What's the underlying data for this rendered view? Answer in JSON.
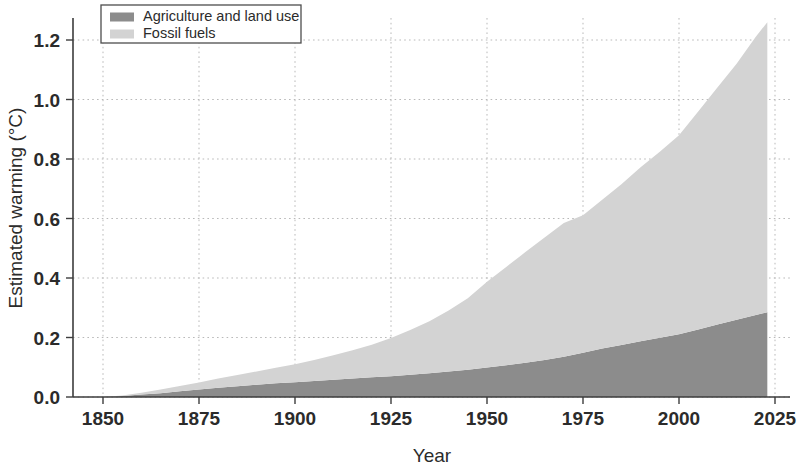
{
  "chart_data": {
    "type": "area",
    "stacked": true,
    "title": "",
    "subtitle": "",
    "xlabel": "Year",
    "ylabel": "Estimated warming (°C)",
    "xlim": [
      1845,
      2032
    ],
    "ylim": [
      -0.03,
      1.33
    ],
    "xticks": [
      1850,
      1875,
      1900,
      1925,
      1950,
      1975,
      2000,
      2025
    ],
    "xticklabels": [
      "1850",
      "1875",
      "1900",
      "1925",
      "1950",
      "1975",
      "2000",
      "2025"
    ],
    "yticks": [
      0.0,
      0.2,
      0.4,
      0.6,
      0.8,
      1.0,
      1.2
    ],
    "yticklabels": [
      "0.0",
      "0.2",
      "0.4",
      "0.6",
      "0.8",
      "1.0",
      "1.2"
    ],
    "grid": true,
    "grid_axis": "both",
    "legend_position": "top-left",
    "x": [
      1850,
      1855,
      1860,
      1865,
      1870,
      1875,
      1880,
      1885,
      1890,
      1895,
      1900,
      1905,
      1910,
      1915,
      1920,
      1925,
      1930,
      1935,
      1940,
      1945,
      1950,
      1955,
      1960,
      1965,
      1970,
      1975,
      1980,
      1985,
      1990,
      1995,
      2000,
      2005,
      2010,
      2015,
      2020,
      2023
    ],
    "series": [
      {
        "name": "Agriculture and land use",
        "color": "#8c8c8c",
        "values": [
          0.0,
          0.003,
          0.008,
          0.013,
          0.019,
          0.025,
          0.031,
          0.036,
          0.041,
          0.046,
          0.05,
          0.054,
          0.058,
          0.062,
          0.066,
          0.07,
          0.075,
          0.08,
          0.086,
          0.092,
          0.099,
          0.107,
          0.115,
          0.124,
          0.135,
          0.149,
          0.163,
          0.175,
          0.187,
          0.199,
          0.211,
          0.227,
          0.244,
          0.26,
          0.276,
          0.285
        ]
      },
      {
        "name": "Fossil fuels",
        "color": "#d3d3d3",
        "values": [
          0.0,
          0.002,
          0.006,
          0.012,
          0.018,
          0.024,
          0.031,
          0.038,
          0.045,
          0.052,
          0.06,
          0.07,
          0.082,
          0.095,
          0.11,
          0.128,
          0.15,
          0.175,
          0.205,
          0.24,
          0.288,
          0.33,
          0.372,
          0.412,
          0.45,
          0.462,
          0.5,
          0.54,
          0.585,
          0.625,
          0.669,
          0.733,
          0.796,
          0.86,
          0.935,
          0.975
        ]
      }
    ],
    "totals": [
      0.0,
      0.005,
      0.014,
      0.025,
      0.037,
      0.049,
      0.062,
      0.074,
      0.086,
      0.098,
      0.11,
      0.124,
      0.14,
      0.157,
      0.176,
      0.198,
      0.225,
      0.255,
      0.291,
      0.332,
      0.387,
      0.437,
      0.487,
      0.536,
      0.585,
      0.611,
      0.663,
      0.715,
      0.772,
      0.824,
      0.88,
      0.96,
      1.04,
      1.12,
      1.211,
      1.26
    ],
    "annotations": []
  },
  "legend": {
    "items": [
      {
        "label": "Agriculture and land use",
        "color": "#8c8c8c"
      },
      {
        "label": "Fossil fuels",
        "color": "#d3d3d3"
      }
    ]
  },
  "axes": {
    "x_title": "Year",
    "y_title": "Estimated warming (°C)"
  }
}
